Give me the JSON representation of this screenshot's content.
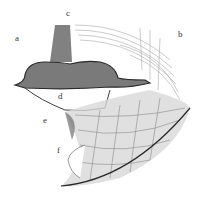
{
  "figure": {
    "labels": [
      {
        "id": "a",
        "text": "a",
        "x": 15,
        "y": 38
      },
      {
        "id": "b",
        "text": "b",
        "x": 178,
        "y": 34
      },
      {
        "id": "c",
        "text": "c",
        "x": 66,
        "y": 13
      },
      {
        "id": "d",
        "text": "d",
        "x": 58,
        "y": 96
      },
      {
        "id": "e",
        "text": "e",
        "x": 43,
        "y": 120
      },
      {
        "id": "f",
        "text": "f",
        "x": 57,
        "y": 150
      }
    ],
    "colors": {
      "ink": "#2a2a2a",
      "shade": "#6b6b6b",
      "hatch": "#9a9a9a",
      "paper": "#ffffff"
    }
  }
}
